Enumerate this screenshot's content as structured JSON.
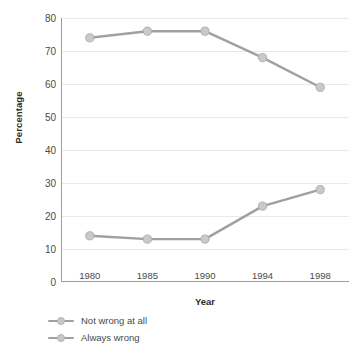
{
  "chart_data": {
    "type": "line",
    "title": "",
    "xlabel": "Year",
    "ylabel": "Percentage",
    "categories": [
      "1980",
      "1985",
      "1990",
      "1994",
      "1998"
    ],
    "ylim": [
      0,
      80
    ],
    "yticks": [
      "0",
      "10",
      "20",
      "30",
      "40",
      "50",
      "60",
      "70",
      "80"
    ],
    "grid": true,
    "legend_position": "bottom-left",
    "series": [
      {
        "name": "Not wrong at all",
        "values": [
          74,
          76,
          76,
          68,
          59
        ],
        "color": "#a0a0a0",
        "marker_color": "#c9c9c9"
      },
      {
        "name": "Always wrong",
        "values": [
          14,
          13,
          13,
          23,
          28
        ],
        "color": "#a0a0a0",
        "marker_color": "#c9c9c9"
      }
    ]
  },
  "colors": {
    "background": "#ffffff",
    "axis": "#9d9d9d",
    "gridline": "#e9e9e9",
    "tick_text": "#4a4a4a",
    "title_text": "#2b2b2b"
  }
}
